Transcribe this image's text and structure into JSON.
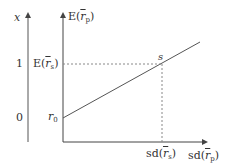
{
  "diagram": {
    "left_axis": {
      "label": "x",
      "tick_top": "1",
      "tick_bottom": "0"
    },
    "right_axis": {
      "y_label_prefix": "E(",
      "y_label_var": "r",
      "y_label_sub": "p",
      "y_label_suffix": ")",
      "x_label_prefix": "sd(",
      "x_label_var": "r",
      "x_label_sub": "p",
      "x_label_suffix": ")"
    },
    "markers": {
      "intercept_var": "r",
      "intercept_sub": "0",
      "point_label": "s",
      "ers_prefix": "E(",
      "ers_var": "r",
      "ers_sub": "s",
      "ers_suffix": ")",
      "sdrs_prefix": "sd(",
      "sdrs_var": "r",
      "sdrs_sub": "s",
      "sdrs_suffix": ")"
    },
    "colors": {
      "axis": "#444444",
      "line": "#555555",
      "dash": "#888888",
      "text": "#333333"
    }
  }
}
